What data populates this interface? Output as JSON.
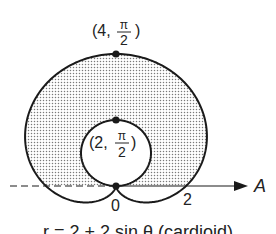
{
  "figure": {
    "curve_equation": "r = 2 + 2 sin θ (cardioid)",
    "top_point": {
      "r": "4",
      "theta_num": "π",
      "theta_den": "2",
      "prefix": "(4,",
      "suffix": ")"
    },
    "inner_point": {
      "r": "2",
      "theta_num": "π",
      "theta_den": "2",
      "prefix": "(2,",
      "suffix": ")"
    },
    "origin_label": "0",
    "axis_tick_label": "2",
    "polar_axis_label": "A",
    "colors": {
      "stroke": "#1a1a1a",
      "dots": "#888888",
      "background": "#ffffff"
    }
  }
}
